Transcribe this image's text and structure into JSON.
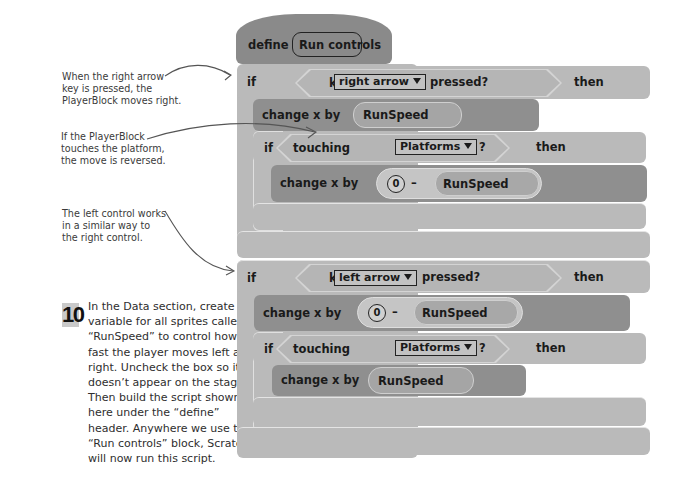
{
  "annotations": [
    {
      "lines": [
        "When the right arrow",
        "key is pressed, the",
        "PlayerBlock moves right."
      ]
    },
    {
      "lines": [
        "If the PlayerBlock",
        "touches the platform,",
        "the move is reversed."
      ]
    },
    {
      "lines": [
        "The left control works",
        "in a similar way to",
        "the right control."
      ]
    }
  ],
  "step": {
    "number": "10",
    "lines": [
      "In the Data section, create a",
      "variable for all sprites called",
      "“RunSpeed” to control how",
      "fast the player moves left and",
      "right. Uncheck the box so it",
      "doesn’t appear on the stage.",
      "Then build the script shown",
      "here under the “define”",
      "header. Anywhere we use the",
      "“Run controls” block, Scratch",
      "will now run this script."
    ]
  },
  "script": {
    "define": {
      "keyword": "define",
      "name": "Run controls"
    },
    "if_right": {
      "if": "if",
      "key": "key",
      "key_option": "right arrow",
      "pressed": "pressed?",
      "then": "then",
      "change": {
        "label": "change x by",
        "variable": "RunSpeed"
      },
      "inner_if": {
        "if": "if",
        "touching": "touching",
        "option": "Platforms",
        "question": "?",
        "then": "then",
        "change": {
          "label": "change x by",
          "number": "0",
          "operator": "–",
          "variable": "RunSpeed"
        }
      }
    },
    "if_left": {
      "if": "if",
      "key": "key",
      "key_option": "left arrow",
      "pressed": "pressed?",
      "then": "then",
      "change": {
        "label": "change x by",
        "number": "0",
        "operator": "–",
        "variable": "RunSpeed"
      },
      "inner_if": {
        "if": "if",
        "touching": "touching",
        "option": "Platforms",
        "question": "?",
        "then": "then",
        "change": {
          "label": "change x by",
          "variable": "RunSpeed"
        }
      }
    }
  },
  "colors": {
    "control_block": "#bababa",
    "motion_block": "#8f8f8f",
    "define_block": "#8a8a8a",
    "text": "#1a1a1a"
  }
}
